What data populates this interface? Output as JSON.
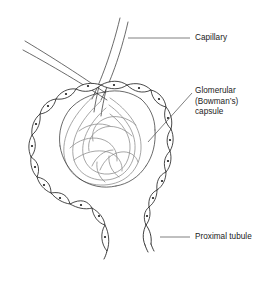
{
  "figure": {
    "background_color": "#ffffff",
    "ink_color": "#1a1a1a",
    "tuft_color": "#8c8c8c",
    "width": 280,
    "height": 286
  },
  "labels": {
    "capillary": {
      "text": "Capillary",
      "leader": "horizontal-left"
    },
    "glomerular": {
      "line1": "Glomerular",
      "line2": "(Bowman’s)",
      "line3": "capsule",
      "leader": "diagonal-down-left"
    },
    "proximal": {
      "text": "Proximal tubule",
      "leader": "horizontal-left"
    }
  },
  "structures": {
    "capsule_name": "glomerular-capsule-outline",
    "tuft_name": "glomerular-capillary-tuft",
    "tubule_name": "proximal-tubule-cell-chain",
    "arteriole_name": "afferent-efferent-arterioles"
  }
}
